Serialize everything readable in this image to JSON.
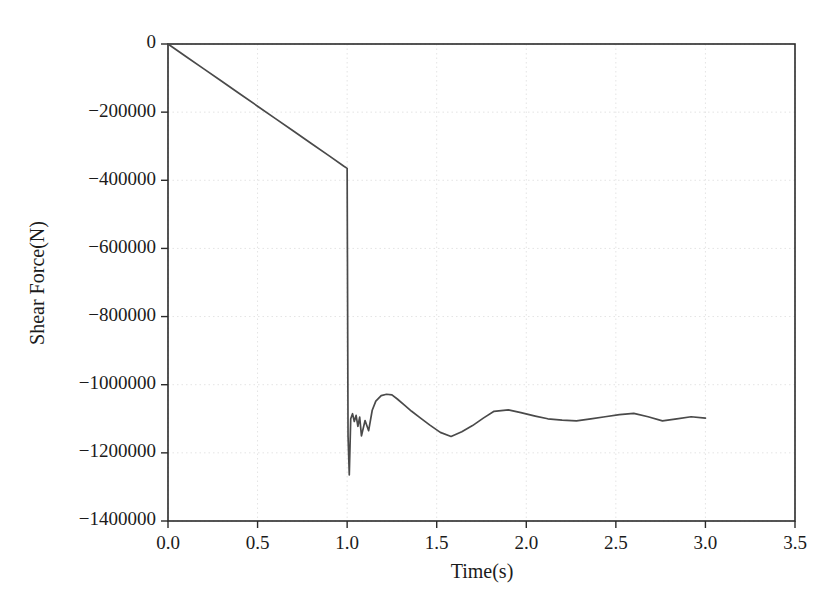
{
  "figure": {
    "background_color": "#ffffff",
    "frame_color": "#2b2b2b",
    "grid_color": "#e4e4e4",
    "line_color": "#4a4a4a"
  },
  "chart_data": {
    "type": "line",
    "title": "",
    "xlabel": "Time(s)",
    "ylabel": "Shear Force(N)",
    "xlim": [
      0.0,
      3.5
    ],
    "ylim": [
      -1400000,
      0
    ],
    "grid": true,
    "legend": null,
    "xticks": [
      0.0,
      0.5,
      1.0,
      1.5,
      2.0,
      2.5,
      3.0,
      3.5
    ],
    "xtick_labels": [
      "0.0",
      "0.5",
      "1.0",
      "1.5",
      "2.0",
      "2.5",
      "3.0",
      "3.5"
    ],
    "yticks": [
      0,
      -200000,
      -400000,
      -600000,
      -800000,
      -1000000,
      -1200000,
      -1400000
    ],
    "ytick_labels": [
      "0",
      "−200000",
      "−400000",
      "−600000",
      "−800000",
      "−1000000",
      "−1200000",
      "−1400000"
    ],
    "series": [
      {
        "name": "Shear Force",
        "color": "#4a4a4a",
        "x": [
          0.0,
          0.1,
          0.2,
          0.3,
          0.4,
          0.5,
          0.6,
          0.7,
          0.8,
          0.9,
          0.98,
          1.0,
          1.005,
          1.012,
          1.02,
          1.03,
          1.04,
          1.05,
          1.06,
          1.07,
          1.08,
          1.1,
          1.12,
          1.14,
          1.16,
          1.19,
          1.22,
          1.25,
          1.28,
          1.32,
          1.36,
          1.41,
          1.46,
          1.52,
          1.58,
          1.64,
          1.7,
          1.76,
          1.82,
          1.9,
          1.97,
          2.05,
          2.12,
          2.2,
          2.28,
          2.36,
          2.44,
          2.52,
          2.6,
          2.68,
          2.76,
          2.84,
          2.92,
          3.0
        ],
        "y": [
          0,
          -36500,
          -73000,
          -109500,
          -146000,
          -182500,
          -219000,
          -255500,
          -292000,
          -328500,
          -358000,
          -365000,
          -1150000,
          -1265000,
          -1100000,
          -1085000,
          -1108000,
          -1090000,
          -1122000,
          -1095000,
          -1150000,
          -1105000,
          -1135000,
          -1075000,
          -1048000,
          -1032000,
          -1028000,
          -1030000,
          -1042000,
          -1060000,
          -1078000,
          -1098000,
          -1118000,
          -1140000,
          -1152000,
          -1138000,
          -1120000,
          -1098000,
          -1078000,
          -1074000,
          -1082000,
          -1092000,
          -1100000,
          -1104000,
          -1106000,
          -1100000,
          -1094000,
          -1088000,
          -1084000,
          -1094000,
          -1106000,
          -1100000,
          -1094000,
          -1098000
        ]
      }
    ]
  }
}
